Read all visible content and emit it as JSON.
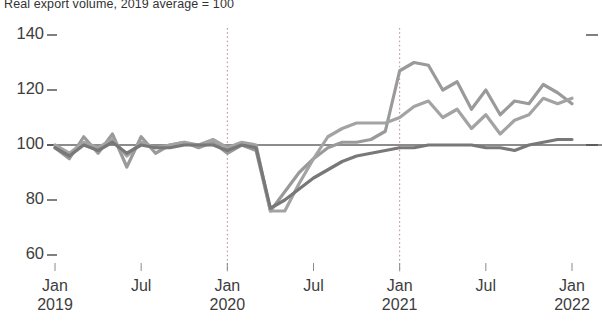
{
  "chart_data": {
    "type": "line",
    "title": "Real export volume, 2019 average = 100",
    "xlabel": "",
    "ylabel": "",
    "ylim": [
      60,
      140
    ],
    "yticks": [
      140,
      120,
      100,
      80,
      60
    ],
    "ytick_labels": [
      "140",
      "120",
      "100",
      "80",
      "60"
    ],
    "grid": false,
    "legend": "none",
    "reference_line": 100,
    "annotations": [
      {
        "type": "vline",
        "x": "Jan 2020",
        "style": "dotted"
      },
      {
        "type": "vline",
        "x": "Jan 2021",
        "style": "dotted"
      }
    ],
    "x": [
      "Jan 2019",
      "Feb 2019",
      "Mar 2019",
      "Apr 2019",
      "May 2019",
      "Jun 2019",
      "Jul 2019",
      "Aug 2019",
      "Sep 2019",
      "Oct 2019",
      "Nov 2019",
      "Dec 2019",
      "Jan 2020",
      "Feb 2020",
      "Mar 2020",
      "Apr 2020",
      "May 2020",
      "Jun 2020",
      "Jul 2020",
      "Aug 2020",
      "Sep 2020",
      "Oct 2020",
      "Nov 2020",
      "Dec 2020",
      "Jan 2021",
      "Feb 2021",
      "Mar 2021",
      "Apr 2021",
      "May 2021",
      "Jun 2021",
      "Jul 2021",
      "Aug 2021",
      "Sep 2021",
      "Oct 2021",
      "Nov 2021",
      "Dec 2021",
      "Jan 2022"
    ],
    "xtick_labels": [
      {
        "month": "Jan",
        "year": "2019"
      },
      {
        "month": "Jul",
        "year": ""
      },
      {
        "month": "Jan",
        "year": "2020"
      },
      {
        "month": "Jul",
        "year": ""
      },
      {
        "month": "Jan",
        "year": "2021"
      },
      {
        "month": "Jul",
        "year": ""
      },
      {
        "month": "Jan",
        "year": "2022"
      }
    ],
    "series": [
      {
        "name": "series-1",
        "color": "#9a9a9a",
        "values": [
          99,
          95,
          103,
          97,
          104,
          92,
          103,
          97,
          100,
          101,
          99,
          101,
          97,
          100,
          98,
          76,
          83,
          90,
          95,
          99,
          101,
          101,
          102,
          105,
          127,
          130,
          129,
          120,
          123,
          113,
          120,
          111,
          116,
          115,
          122,
          119,
          115
        ]
      },
      {
        "name": "series-2",
        "color": "#a3a3a3",
        "values": [
          100,
          97,
          101,
          99,
          102,
          96,
          101,
          99,
          100,
          101,
          100,
          102,
          99,
          101,
          100,
          76,
          76,
          86,
          95,
          103,
          106,
          108,
          108,
          108,
          110,
          114,
          116,
          110,
          113,
          106,
          111,
          104,
          109,
          111,
          117,
          115,
          117
        ]
      },
      {
        "name": "series-3",
        "color": "#787878",
        "values": [
          99,
          96,
          100,
          98,
          101,
          97,
          100,
          99,
          99,
          100,
          100,
          100,
          98,
          100,
          99,
          77,
          80,
          84,
          88,
          91,
          94,
          96,
          97,
          98,
          99,
          99,
          100,
          100,
          100,
          100,
          99,
          99,
          98,
          100,
          101,
          102,
          102
        ]
      }
    ]
  }
}
